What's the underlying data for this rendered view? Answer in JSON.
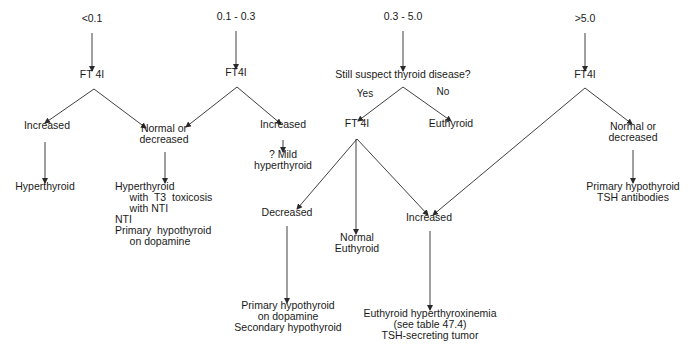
{
  "diagram": {
    "title": "",
    "colors": {
      "line": "#2a2a2a",
      "text": "#1a1a1a",
      "background": "#ffffff"
    },
    "nodes": [
      {
        "id": "tsh_lt01",
        "lines": [
          "<0.1"
        ],
        "x": 92,
        "y": 19,
        "align": "center"
      },
      {
        "id": "tsh_01_03",
        "lines": [
          "0.1 - 0.3"
        ],
        "x": 236,
        "y": 17,
        "align": "center"
      },
      {
        "id": "tsh_03_50",
        "lines": [
          "0.3 - 5.0"
        ],
        "x": 403,
        "y": 17,
        "align": "center"
      },
      {
        "id": "tsh_gt50",
        "lines": [
          ">5.0"
        ],
        "x": 585,
        "y": 19,
        "align": "center"
      },
      {
        "id": "ft4i_a",
        "lines": [
          "FT 4I"
        ],
        "x": 92,
        "y": 75,
        "align": "center"
      },
      {
        "id": "ft4i_b",
        "lines": [
          "FT4I"
        ],
        "x": 236,
        "y": 73,
        "align": "center"
      },
      {
        "id": "suspect",
        "lines": [
          "Still suspect thyroid disease?"
        ],
        "x": 403,
        "y": 75,
        "align": "center"
      },
      {
        "id": "ft4i_d",
        "lines": [
          "FT4I"
        ],
        "x": 585,
        "y": 75,
        "align": "center"
      },
      {
        "id": "a_increased",
        "lines": [
          "Increased"
        ],
        "x": 47,
        "y": 126,
        "align": "center"
      },
      {
        "id": "a_normal",
        "lines": [
          "Normal or",
          "decreased"
        ],
        "x": 164,
        "y": 129,
        "align": "center"
      },
      {
        "id": "b_increased",
        "lines": [
          "Increased"
        ],
        "x": 283,
        "y": 125,
        "align": "center"
      },
      {
        "id": "b_mild",
        "lines": [
          "? Mild",
          "hyperthyroid"
        ],
        "x": 283,
        "y": 155,
        "align": "center"
      },
      {
        "id": "yes_label",
        "lines": [
          "Yes"
        ],
        "x": 365,
        "y": 94,
        "align": "center",
        "small": true
      },
      {
        "id": "no_label",
        "lines": [
          "No"
        ],
        "x": 443,
        "y": 92,
        "align": "center",
        "small": true
      },
      {
        "id": "c_ft4i",
        "lines": [
          "FT 4I"
        ],
        "x": 357,
        "y": 124,
        "align": "center"
      },
      {
        "id": "c_euthyroid",
        "lines": [
          "Euthyroid"
        ],
        "x": 451,
        "y": 124,
        "align": "center"
      },
      {
        "id": "d_normal",
        "lines": [
          "Normal or",
          "decreased"
        ],
        "x": 633,
        "y": 127,
        "align": "center"
      },
      {
        "id": "a_hyper",
        "lines": [
          "Hyperthyroid"
        ],
        "x": 45,
        "y": 187,
        "align": "center"
      },
      {
        "id": "a_list",
        "lines": [
          "Hyperthyroid",
          "     with  T3  toxicosis",
          "     with NTI",
          "NTI",
          "Primary  hypothyroid",
          "     on dopamine"
        ],
        "x": 115,
        "y": 187,
        "align": "left"
      },
      {
        "id": "c_decreased",
        "lines": [
          "Decreased"
        ],
        "x": 287,
        "y": 213,
        "align": "center"
      },
      {
        "id": "c_normal",
        "lines": [
          "Normal",
          "Euthyroid"
        ],
        "x": 357,
        "y": 238,
        "align": "center"
      },
      {
        "id": "c_increased",
        "lines": [
          "Increased"
        ],
        "x": 429,
        "y": 218,
        "align": "center"
      },
      {
        "id": "d_result",
        "lines": [
          "Primary hypothyroid",
          "TSH antibodies"
        ],
        "x": 633,
        "y": 187,
        "align": "center"
      },
      {
        "id": "c_dec_result",
        "lines": [
          "Primary hypothyroid",
          "on dopamine",
          "Secondary hypothyroid"
        ],
        "x": 288,
        "y": 306,
        "align": "center"
      },
      {
        "id": "c_inc_result",
        "lines": [
          "Euthyroid hyperthyroxinemia",
          "(see table 47.4)",
          "TSH-secreting tumor"
        ],
        "x": 430,
        "y": 314,
        "align": "center"
      }
    ],
    "edges": [
      {
        "from": [
          92,
          33
        ],
        "to": [
          92,
          71
        ]
      },
      {
        "from": [
          236,
          31
        ],
        "to": [
          236,
          69
        ]
      },
      {
        "from": [
          403,
          31
        ],
        "to": [
          403,
          71
        ]
      },
      {
        "from": [
          585,
          33
        ],
        "to": [
          585,
          71
        ]
      },
      {
        "from": [
          94,
          89
        ],
        "to": [
          45,
          123
        ]
      },
      {
        "from": [
          94,
          89
        ],
        "to": [
          146,
          128
        ]
      },
      {
        "from": [
          237,
          87
        ],
        "to": [
          186,
          127
        ]
      },
      {
        "from": [
          237,
          87
        ],
        "to": [
          281,
          124
        ]
      },
      {
        "from": [
          403,
          87
        ],
        "to": [
          358,
          121
        ]
      },
      {
        "from": [
          403,
          87
        ],
        "to": [
          451,
          121
        ]
      },
      {
        "from": [
          585,
          88
        ],
        "to": [
          632,
          124
        ]
      },
      {
        "from": [
          585,
          88
        ],
        "to": [
          433,
          215
        ]
      },
      {
        "from": [
          45,
          142
        ],
        "to": [
          45,
          183
        ]
      },
      {
        "from": [
          165,
          152
        ],
        "to": [
          165,
          183
        ]
      },
      {
        "from": [
          283,
          140
        ],
        "to": [
          283,
          152
        ]
      },
      {
        "from": [
          633,
          150
        ],
        "to": [
          633,
          183
        ]
      },
      {
        "from": [
          357,
          139
        ],
        "to": [
          297,
          209
        ]
      },
      {
        "from": [
          356,
          139
        ],
        "to": [
          356,
          234
        ]
      },
      {
        "from": [
          357,
          139
        ],
        "to": [
          428,
          215
        ]
      },
      {
        "from": [
          287,
          226
        ],
        "to": [
          287,
          303
        ]
      },
      {
        "from": [
          430,
          231
        ],
        "to": [
          430,
          310
        ]
      }
    ]
  }
}
